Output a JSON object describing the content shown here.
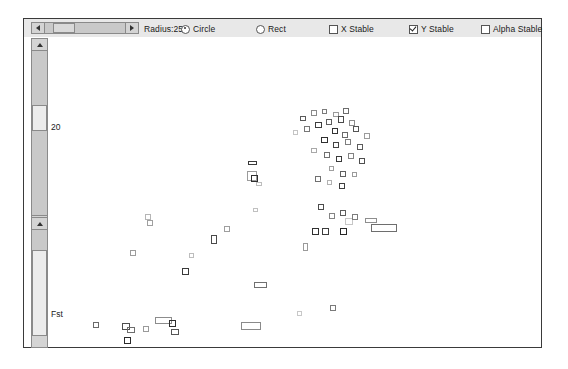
{
  "window": {
    "title": "Particle Simulation Applet"
  },
  "toolbar": {
    "slider": {
      "name": "radius-slider",
      "label": "Radius:25",
      "value": 25,
      "left_arrow": "◄",
      "right_arrow": "►"
    },
    "radios": [
      {
        "label": "Circle",
        "checked": true,
        "name": "radio-circle"
      },
      {
        "label": "Rect",
        "checked": false,
        "name": "radio-rect"
      }
    ],
    "checkboxes": [
      {
        "label": "X Stable",
        "checked": false,
        "name": "checkbox-x-stable"
      },
      {
        "label": "Y Stable",
        "checked": true,
        "name": "checkbox-y-stable"
      },
      {
        "label": "Alpha Stable",
        "checked": false,
        "name": "checkbox-alpha-stable"
      }
    ]
  },
  "gutter": {
    "scroll_top_label": "20",
    "scroll_bottom_label": "Fst"
  },
  "colors": {
    "frame_border": "#3a3a3a",
    "toolbar_bg": "#e8e8e8",
    "scroll_track": "#c9c9c9",
    "scroll_thumb": "#d9d9d9",
    "canvas_bg": "#ffffff",
    "marker_dark": "#2b2b2b",
    "marker_mid": "#7a7a7a",
    "marker_light": "#bcbcbc"
  },
  "chart_data": {
    "type": "scatter",
    "title": "",
    "xlabel": "",
    "ylabel": "",
    "grid": false,
    "legend": "none",
    "marker_shape": "hollow-square",
    "xlim": [
      0,
      447
    ],
    "ylim": [
      0,
      309
    ],
    "note": "Pixel coordinates relative to the plot canvas origin (left 69, top 19).",
    "points": [
      {
        "x": 207,
        "y": 78,
        "w": 6,
        "h": 5,
        "c": "#5a5a5a"
      },
      {
        "x": 218,
        "y": 72,
        "w": 6,
        "h": 6,
        "c": "#8a8a8a"
      },
      {
        "x": 229,
        "y": 71,
        "w": 5,
        "h": 5,
        "c": "#7b7b7b"
      },
      {
        "x": 240,
        "y": 74,
        "w": 6,
        "h": 5,
        "c": "#9a9a9a"
      },
      {
        "x": 250,
        "y": 70,
        "w": 6,
        "h": 6,
        "c": "#6c6c6c"
      },
      {
        "x": 200,
        "y": 92,
        "w": 5,
        "h": 5,
        "c": "#c4c4c4"
      },
      {
        "x": 211,
        "y": 88,
        "w": 6,
        "h": 6,
        "c": "#777777"
      },
      {
        "x": 222,
        "y": 84,
        "w": 7,
        "h": 6,
        "c": "#3d3d3d"
      },
      {
        "x": 233,
        "y": 81,
        "w": 6,
        "h": 6,
        "c": "#5e5e5e"
      },
      {
        "x": 245,
        "y": 78,
        "w": 6,
        "h": 7,
        "c": "#4a4a4a"
      },
      {
        "x": 256,
        "y": 82,
        "w": 6,
        "h": 6,
        "c": "#8d8d8d"
      },
      {
        "x": 239,
        "y": 90,
        "w": 6,
        "h": 6,
        "c": "#333333"
      },
      {
        "x": 249,
        "y": 94,
        "w": 6,
        "h": 6,
        "c": "#6a6a6a"
      },
      {
        "x": 260,
        "y": 88,
        "w": 6,
        "h": 6,
        "c": "#555555"
      },
      {
        "x": 271,
        "y": 95,
        "w": 6,
        "h": 6,
        "c": "#9c9c9c"
      },
      {
        "x": 228,
        "y": 99,
        "w": 7,
        "h": 6,
        "c": "#2f2f2f"
      },
      {
        "x": 240,
        "y": 104,
        "w": 6,
        "h": 6,
        "c": "#444444"
      },
      {
        "x": 252,
        "y": 101,
        "w": 6,
        "h": 6,
        "c": "#7e7e7e"
      },
      {
        "x": 264,
        "y": 106,
        "w": 6,
        "h": 6,
        "c": "#5b5b5b"
      },
      {
        "x": 218,
        "y": 110,
        "w": 6,
        "h": 5,
        "c": "#a8a8a8"
      },
      {
        "x": 231,
        "y": 114,
        "w": 6,
        "h": 6,
        "c": "#6f6f6f"
      },
      {
        "x": 243,
        "y": 118,
        "w": 6,
        "h": 6,
        "c": "#3a3a3a"
      },
      {
        "x": 255,
        "y": 115,
        "w": 6,
        "h": 6,
        "c": "#828282"
      },
      {
        "x": 266,
        "y": 120,
        "w": 6,
        "h": 6,
        "c": "#4e4e4e"
      },
      {
        "x": 236,
        "y": 128,
        "w": 5,
        "h": 5,
        "c": "#9f9f9f"
      },
      {
        "x": 247,
        "y": 133,
        "w": 6,
        "h": 6,
        "c": "#606060"
      },
      {
        "x": 222,
        "y": 138,
        "w": 6,
        "h": 6,
        "c": "#707070"
      },
      {
        "x": 234,
        "y": 142,
        "w": 5,
        "h": 5,
        "c": "#b2b2b2"
      },
      {
        "x": 246,
        "y": 145,
        "w": 6,
        "h": 6,
        "c": "#3f3f3f"
      },
      {
        "x": 259,
        "y": 134,
        "w": 5,
        "h": 5,
        "c": "#9a9a9a"
      },
      {
        "x": 155,
        "y": 123,
        "w": 9,
        "h": 4,
        "c": "#3a3a3a"
      },
      {
        "x": 154,
        "y": 133,
        "w": 10,
        "h": 10,
        "c": "#9b9b9b"
      },
      {
        "x": 158,
        "y": 137,
        "w": 7,
        "h": 7,
        "c": "#2e2e2e"
      },
      {
        "x": 163,
        "y": 144,
        "w": 6,
        "h": 4,
        "c": "#bdbdbd"
      },
      {
        "x": 160,
        "y": 170,
        "w": 5,
        "h": 4,
        "c": "#c0c0c0"
      },
      {
        "x": 225,
        "y": 166,
        "w": 6,
        "h": 6,
        "c": "#4b4b4b"
      },
      {
        "x": 236,
        "y": 175,
        "w": 6,
        "h": 6,
        "c": "#848484"
      },
      {
        "x": 247,
        "y": 172,
        "w": 6,
        "h": 6,
        "c": "#5d5d5d"
      },
      {
        "x": 252,
        "y": 180,
        "w": 8,
        "h": 7,
        "c": "#c6c6c6"
      },
      {
        "x": 259,
        "y": 176,
        "w": 6,
        "h": 6,
        "c": "#7c7c7c"
      },
      {
        "x": 219,
        "y": 190,
        "w": 7,
        "h": 7,
        "c": "#303030"
      },
      {
        "x": 229,
        "y": 190,
        "w": 7,
        "h": 7,
        "c": "#3c3c3c"
      },
      {
        "x": 247,
        "y": 190,
        "w": 7,
        "h": 7,
        "c": "#272727"
      },
      {
        "x": 272,
        "y": 180,
        "w": 12,
        "h": 5,
        "c": "#8e8e8e"
      },
      {
        "x": 278,
        "y": 186,
        "w": 26,
        "h": 8,
        "c": "#6e6e6e"
      },
      {
        "x": 210,
        "y": 205,
        "w": 5,
        "h": 8,
        "c": "#9a9a9a"
      },
      {
        "x": 52,
        "y": 176,
        "w": 6,
        "h": 6,
        "c": "#b5b5b5"
      },
      {
        "x": 54,
        "y": 182,
        "w": 6,
        "h": 6,
        "c": "#a0a0a0"
      },
      {
        "x": 118,
        "y": 197,
        "w": 6,
        "h": 9,
        "c": "#4a4a4a"
      },
      {
        "x": 131,
        "y": 188,
        "w": 6,
        "h": 6,
        "c": "#9e9e9e"
      },
      {
        "x": 96,
        "y": 215,
        "w": 5,
        "h": 5,
        "c": "#bdbdbd"
      },
      {
        "x": 37,
        "y": 212,
        "w": 6,
        "h": 6,
        "c": "#9c9c9c"
      },
      {
        "x": 89,
        "y": 230,
        "w": 7,
        "h": 7,
        "c": "#3a3a3a"
      },
      {
        "x": 161,
        "y": 244,
        "w": 13,
        "h": 6,
        "c": "#707070"
      },
      {
        "x": 29,
        "y": 285,
        "w": 8,
        "h": 7,
        "c": "#4e4e4e"
      },
      {
        "x": 34,
        "y": 289,
        "w": 8,
        "h": 6,
        "c": "#6d6d6d"
      },
      {
        "x": 31,
        "y": 299,
        "w": 7,
        "h": 7,
        "c": "#2a2a2a"
      },
      {
        "x": 62,
        "y": 279,
        "w": 17,
        "h": 7,
        "c": "#8c8c8c"
      },
      {
        "x": 50,
        "y": 288,
        "w": 6,
        "h": 6,
        "c": "#9a9a9a"
      },
      {
        "x": 0,
        "y": 284,
        "w": 6,
        "h": 6,
        "c": "#6a6a6a"
      },
      {
        "x": 76,
        "y": 282,
        "w": 7,
        "h": 7,
        "c": "#2d2d2d"
      },
      {
        "x": 78,
        "y": 291,
        "w": 8,
        "h": 6,
        "c": "#555555"
      },
      {
        "x": 148,
        "y": 284,
        "w": 20,
        "h": 8,
        "c": "#8a8a8a"
      },
      {
        "x": 204,
        "y": 273,
        "w": 5,
        "h": 5,
        "c": "#c8c8c8"
      },
      {
        "x": 237,
        "y": 267,
        "w": 6,
        "h": 6,
        "c": "#7a7a7a"
      }
    ]
  }
}
